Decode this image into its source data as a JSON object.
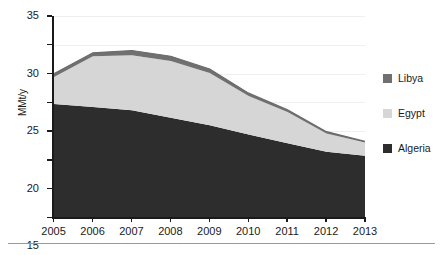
{
  "chart_data": {
    "type": "area",
    "stacked": true,
    "title": "",
    "xlabel": "",
    "ylabel": "MMt/y",
    "categories": [
      "2005",
      "2006",
      "2007",
      "2008",
      "2009",
      "2010",
      "2011",
      "2012",
      "2013"
    ],
    "x": [
      2005,
      2006,
      2007,
      2008,
      2009,
      2010,
      2011,
      2012,
      2013
    ],
    "series": [
      {
        "name": "Algeria",
        "color": "#2d2d2d",
        "values": [
          19.7,
          19.2,
          18.6,
          17.3,
          16.0,
          14.4,
          12.9,
          11.4,
          10.7
        ]
      },
      {
        "name": "Egypt",
        "color": "#d6d6d6",
        "values": [
          4.7,
          8.8,
          9.6,
          9.9,
          9.1,
          6.7,
          5.4,
          3.2,
          2.3
        ]
      },
      {
        "name": "Libya",
        "color": "#707070",
        "values": [
          0.6,
          0.6,
          0.8,
          0.8,
          0.7,
          0.5,
          0.4,
          0.3,
          0.2
        ]
      }
    ],
    "totals": [
      25.0,
      28.6,
      29.0,
      28.0,
      25.8,
      21.6,
      18.7,
      14.9,
      13.2
    ],
    "ylim": [
      0,
      35
    ],
    "yticks": [
      0,
      5,
      10,
      15,
      20,
      25,
      30,
      35
    ],
    "grid": true,
    "legend_position": "right"
  },
  "legend": {
    "items": [
      {
        "label": "Libya",
        "color": "#707070"
      },
      {
        "label": "Egypt",
        "color": "#d6d6d6"
      },
      {
        "label": "Algeria",
        "color": "#2d2d2d"
      }
    ]
  },
  "axes": {
    "y_title": "MMt/y",
    "y_tick_labels": [
      "35",
      "30",
      "25",
      "20",
      "15",
      "10",
      "5",
      "0"
    ],
    "x_tick_labels": [
      "2005",
      "2006",
      "2007",
      "2008",
      "2009",
      "2010",
      "2011",
      "2012",
      "2013"
    ]
  }
}
